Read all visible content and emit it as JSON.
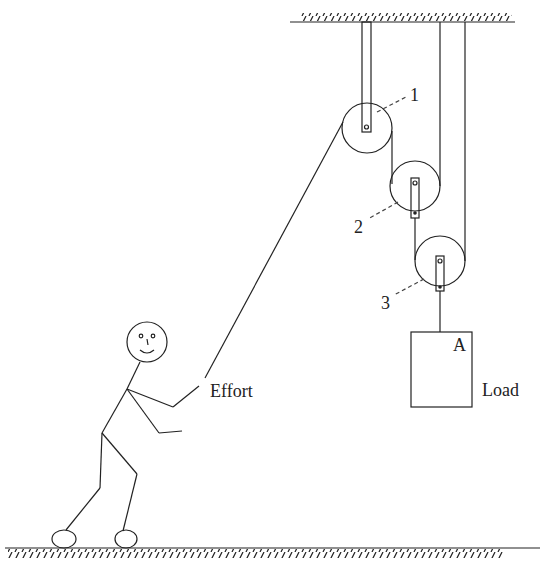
{
  "diagram": {
    "type": "compound pulley system",
    "labels": {
      "pulley_1": "1",
      "pulley_2": "2",
      "pulley_3": "3",
      "load_point": "A",
      "load": "Load",
      "effort": "Effort"
    },
    "colors": {
      "line": "#222222",
      "background": "#ffffff"
    }
  }
}
